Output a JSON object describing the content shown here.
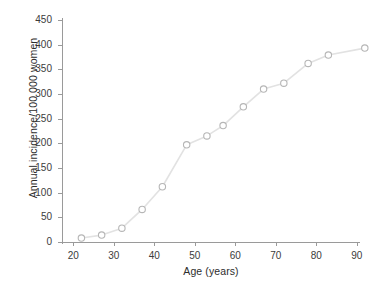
{
  "chart_data": {
    "type": "scatter",
    "title": "",
    "xlabel": "Age (years)",
    "ylabel": "Annual incidence/100 000 women",
    "xlim": [
      17,
      95
    ],
    "ylim": [
      0,
      450
    ],
    "xticks": [
      20,
      30,
      40,
      50,
      60,
      70,
      80,
      90
    ],
    "yticks": [
      0,
      50,
      100,
      150,
      200,
      250,
      300,
      350,
      400,
      450
    ],
    "grid": false,
    "legend": null,
    "marker": "open-circle",
    "series": [
      {
        "name": "Annual incidence",
        "x": [
          22,
          27,
          32,
          37,
          42,
          48,
          53,
          57,
          62,
          67,
          72,
          78,
          83,
          92
        ],
        "values": [
          8,
          14,
          28,
          66,
          112,
          197,
          215,
          236,
          274,
          310,
          322,
          362,
          379,
          393
        ]
      }
    ]
  },
  "axes": {
    "x_title": "Age (years)",
    "y_title": "Annual incidence/100 000 women",
    "x_tick_labels": [
      "20",
      "30",
      "40",
      "50",
      "60",
      "70",
      "80",
      "90"
    ],
    "y_tick_labels": [
      "0",
      "50",
      "100",
      "150",
      "200",
      "250",
      "300",
      "350",
      "400",
      "450"
    ]
  },
  "style": {
    "axis_color": "#9a9a9a",
    "line_color": "#e2e2e2",
    "marker_fill": "#ffffff",
    "marker_stroke": "#b6b6b6",
    "text_color": "#2d2d2d",
    "background": "#ffffff"
  }
}
